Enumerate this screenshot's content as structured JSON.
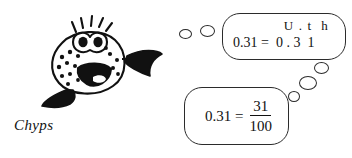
{
  "canvas": {
    "width": 352,
    "height": 158,
    "background": "#ffffff",
    "ink": "#111111"
  },
  "character": {
    "name": "Chyps",
    "label": "Chyps",
    "icon": "spotted-pufferfish-cartoon",
    "description": "smiling spotted fish with big eyes, tail fin and bottom fin"
  },
  "thought_trail_top": {
    "dots": [
      {
        "name": "thought-dot-small",
        "left": 179,
        "top": 29,
        "width": 11,
        "height": 8
      },
      {
        "name": "thought-dot-medium",
        "left": 200,
        "top": 25,
        "width": 13,
        "height": 10
      }
    ]
  },
  "thought_trail_bottom": {
    "dots": [
      {
        "name": "thought-dot-large",
        "left": 314,
        "top": 62,
        "width": 13,
        "height": 10
      },
      {
        "name": "thought-dot-medium",
        "left": 299,
        "top": 76,
        "width": 16,
        "height": 12
      },
      {
        "name": "thought-dot-small",
        "left": 288,
        "top": 91,
        "width": 10,
        "height": 9
      }
    ]
  },
  "place_value_box": {
    "name": "place-value-speech-box",
    "header": "U . t  h",
    "header_columns": [
      "U",
      ".",
      "t",
      "h"
    ],
    "equation": "0.31 =  0 . 3  1",
    "equation_left": "0.31",
    "equation_operator": "=",
    "equation_digits": [
      "0",
      ".",
      "3",
      "1"
    ]
  },
  "fraction_box": {
    "name": "fraction-speech-box",
    "lhs": "0.31 =",
    "numerator": "31",
    "denominator": "100",
    "full_text": "0.31 = 31/100"
  }
}
